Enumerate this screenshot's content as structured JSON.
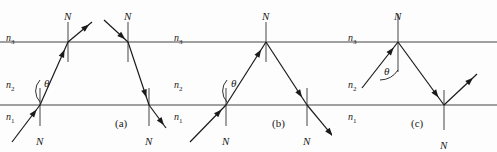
{
  "figure": {
    "width": 497,
    "height": 152,
    "background_color": "#fdfdfd",
    "interface_line_color": "#808080",
    "ray_color": "#1a1a1a",
    "normal_color": "#555555",
    "text_color": "#1a1a1a",
    "top_interface_y": 42,
    "bottom_interface_y": 105
  },
  "labels": {
    "normal": "N",
    "theta": "θ",
    "medium_top": "n",
    "medium_top_sub": "3",
    "medium_mid": "n",
    "medium_mid_sub": "2",
    "medium_bot": "n",
    "medium_bot_sub": "1"
  },
  "panels": [
    {
      "id": "a",
      "caption": "(a)",
      "caption_x": 115,
      "caption_y": 118,
      "x_offset": 0,
      "width": 168,
      "media": [
        {
          "name": "n3",
          "symbol": "n",
          "subscript": "3",
          "x": 6,
          "y": 33
        },
        {
          "name": "n2",
          "symbol": "n",
          "subscript": "2",
          "x": 6,
          "y": 80
        },
        {
          "name": "n1",
          "symbol": "n",
          "subscript": "1",
          "x": 6,
          "y": 112
        }
      ],
      "normals": [
        {
          "name": "normal-top-left",
          "x": 68,
          "y_top": 22,
          "y_bot": 62,
          "label_x": 64,
          "label_y": 11
        },
        {
          "name": "normal-top-right",
          "x": 128,
          "y_top": 22,
          "y_bot": 62,
          "label_x": 124,
          "label_y": 11
        },
        {
          "name": "normal-bottom-left",
          "x": 40,
          "y_top": 88,
          "y_bot": 126,
          "label_x": 36,
          "label_y": 136
        },
        {
          "name": "normal-bottom-right",
          "x": 149,
          "y_top": 88,
          "y_bot": 126,
          "label_x": 145,
          "label_y": 136
        }
      ],
      "theta": {
        "x": 44,
        "y": 78
      },
      "rays": [
        {
          "name": "incident-ray",
          "x1": 12,
          "y1": 142,
          "x2": 40,
          "y2": 105,
          "arrow": true
        },
        {
          "name": "refracted-ray-mid",
          "x1": 40,
          "y1": 105,
          "x2": 68,
          "y2": 42,
          "arrow": true
        },
        {
          "name": "transmitted-ray-top-left",
          "x1": 68,
          "y1": 42,
          "x2": 92,
          "y2": 22,
          "arrow": true
        },
        {
          "name": "incoming-ray-top-right",
          "x1": 104,
          "y1": 20,
          "x2": 128,
          "y2": 42,
          "arrow": true
        },
        {
          "name": "refracted-ray-right",
          "x1": 128,
          "y1": 42,
          "x2": 149,
          "y2": 105,
          "arrow": true
        },
        {
          "name": "exit-ray-bottom-right",
          "x1": 149,
          "y1": 105,
          "x2": 166,
          "y2": 128,
          "arrow": true
        }
      ]
    },
    {
      "id": "b",
      "caption": "(b)",
      "caption_x": 272,
      "caption_y": 118,
      "x_offset": 168,
      "width": 164,
      "media": [
        {
          "name": "n3",
          "symbol": "n",
          "subscript": "3",
          "x": 6,
          "y": 33
        },
        {
          "name": "n2",
          "symbol": "n",
          "subscript": "2",
          "x": 6,
          "y": 80
        },
        {
          "name": "n1",
          "symbol": "n",
          "subscript": "1",
          "x": 6,
          "y": 112
        }
      ],
      "normals": [
        {
          "name": "normal-top",
          "x": 98,
          "y_top": 22,
          "y_bot": 62,
          "label_x": 94,
          "label_y": 11
        },
        {
          "name": "normal-bottom-left",
          "x": 58,
          "y_top": 88,
          "y_bot": 126,
          "label_x": 54,
          "label_y": 136
        },
        {
          "name": "normal-bottom-right",
          "x": 139,
          "y_top": 88,
          "y_bot": 126,
          "label_x": 135,
          "label_y": 136
        }
      ],
      "theta": {
        "x": 63,
        "y": 78
      },
      "rays": [
        {
          "name": "incident-ray",
          "x1": 22,
          "y1": 142,
          "x2": 58,
          "y2": 105,
          "arrow": true
        },
        {
          "name": "refracted-ray-mid",
          "x1": 58,
          "y1": 105,
          "x2": 98,
          "y2": 42,
          "arrow": true
        },
        {
          "name": "total-internal-reflected-ray",
          "x1": 98,
          "y1": 42,
          "x2": 139,
          "y2": 105,
          "arrow": true
        },
        {
          "name": "exit-ray-bottom",
          "x1": 139,
          "y1": 105,
          "x2": 168,
          "y2": 140,
          "arrow": true
        }
      ]
    },
    {
      "id": "c",
      "caption": "(c)",
      "caption_x": 411,
      "caption_y": 118,
      "x_offset": 332,
      "width": 165,
      "media": [
        {
          "name": "n3",
          "symbol": "n",
          "subscript": "3",
          "x": 16,
          "y": 33
        },
        {
          "name": "n2",
          "symbol": "n",
          "subscript": "2",
          "x": 16,
          "y": 80
        },
        {
          "name": "n1",
          "symbol": "n",
          "subscript": "1",
          "x": 16,
          "y": 112
        }
      ],
      "normals": [
        {
          "name": "normal-top",
          "x": 66,
          "y_top": 14,
          "y_bot": 72,
          "label_x": 62,
          "label_y": 11
        },
        {
          "name": "normal-bottom",
          "x": 112,
          "y_top": 90,
          "y_bot": 130,
          "label_x": 108,
          "label_y": 140
        }
      ],
      "theta": {
        "x": 52,
        "y": 66
      },
      "rays": [
        {
          "name": "incident-ray-upward",
          "x1": 30,
          "y1": 88,
          "x2": 66,
          "y2": 42,
          "arrow": true
        },
        {
          "name": "reflected-ray-downward",
          "x1": 66,
          "y1": 42,
          "x2": 112,
          "y2": 105,
          "arrow": true
        },
        {
          "name": "reflected-ray-upward-right",
          "x1": 112,
          "y1": 105,
          "x2": 145,
          "y2": 74,
          "arrow": true
        }
      ]
    }
  ]
}
